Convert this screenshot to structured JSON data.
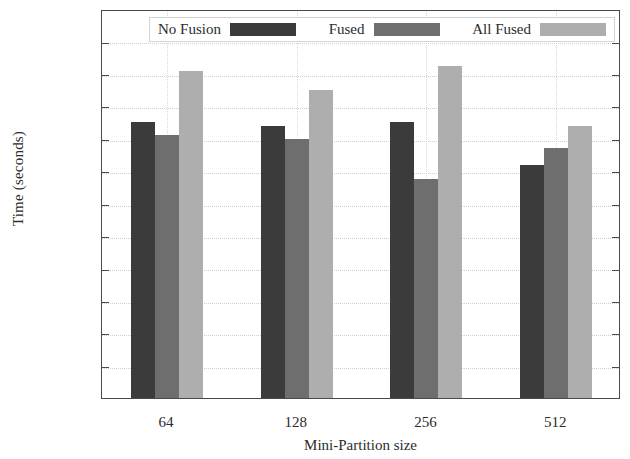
{
  "chart_data": {
    "type": "bar",
    "title": "",
    "xlabel": "Mini-Partition size",
    "ylabel": "Time (seconds)",
    "categories": [
      "64",
      "128",
      "256",
      "512"
    ],
    "series": [
      {
        "name": "No Fusion",
        "color": "#3b3b3b",
        "values": [
          85,
          84,
          85,
          72
        ]
      },
      {
        "name": "Fused",
        "color": "#6e6e6e",
        "values": [
          81,
          80,
          67.5,
          77
        ]
      },
      {
        "name": "All Fused",
        "color": "#aeaeae",
        "values": [
          101,
          95,
          102.5,
          84
        ]
      }
    ],
    "ylim": [
      0,
      120
    ],
    "ytick_labels": [
      "0",
      "10",
      "20",
      "30",
      "40",
      "50",
      "60",
      "70",
      "80",
      "90",
      "100",
      "110",
      "120"
    ],
    "ytick_values": [
      0,
      10,
      20,
      30,
      40,
      50,
      60,
      70,
      80,
      90,
      100,
      110,
      120
    ],
    "grid": true,
    "legend_position": "top-inside"
  }
}
